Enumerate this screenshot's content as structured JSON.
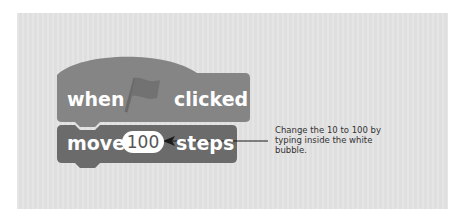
{
  "scene": {
    "background_color": "#e3e3e3",
    "hat_block_color": "#858585",
    "motion_block_color": "#6b6b6b"
  },
  "hat_block": {
    "label_before": "when",
    "icon": "green-flag-icon",
    "label_after": "clicked"
  },
  "motion_block": {
    "label_before": "move",
    "input_value": "100",
    "label_after": "steps"
  },
  "annotation": {
    "text": "Change the 10 to 100 by typing inside the white bubble.",
    "arrow_color": "#1a1a1a"
  }
}
